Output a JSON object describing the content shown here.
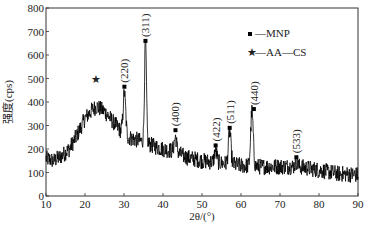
{
  "chart_data": {
    "type": "line",
    "title": "",
    "xlabel": "2θ/(°)",
    "ylabel": "强度(cps)",
    "xlim": [
      10,
      90
    ],
    "ylim": [
      0,
      800
    ],
    "xticks": [
      10,
      20,
      30,
      40,
      50,
      60,
      70,
      80,
      90
    ],
    "yticks": [
      0,
      100,
      200,
      300,
      400,
      500,
      600,
      700,
      800
    ],
    "grid": false,
    "legend": {
      "position": "upper right",
      "entries": [
        {
          "marker": "square",
          "label": "—MNP"
        },
        {
          "marker": "star",
          "label": "—AA—CS"
        }
      ]
    },
    "series": [
      {
        "name": "XRD pattern",
        "baseline_points": [
          [
            10,
            160
          ],
          [
            12,
            150
          ],
          [
            14,
            170
          ],
          [
            16,
            200
          ],
          [
            18,
            260
          ],
          [
            20,
            330
          ],
          [
            22,
            370
          ],
          [
            23,
            380
          ],
          [
            25,
            360
          ],
          [
            27,
            320
          ],
          [
            29,
            280
          ],
          [
            31,
            250
          ],
          [
            33,
            240
          ],
          [
            35,
            230
          ],
          [
            38,
            210
          ],
          [
            40,
            200
          ],
          [
            43,
            190
          ],
          [
            46,
            165
          ],
          [
            50,
            150
          ],
          [
            55,
            140
          ],
          [
            60,
            130
          ],
          [
            65,
            125
          ],
          [
            70,
            125
          ],
          [
            75,
            125
          ],
          [
            80,
            110
          ],
          [
            85,
            95
          ],
          [
            90,
            90
          ]
        ],
        "peaks": [
          {
            "x": 30.1,
            "y": 440,
            "hkl": "(220)",
            "phase": "MNP"
          },
          {
            "x": 35.5,
            "y": 655,
            "hkl": "(311)",
            "phase": "MNP"
          },
          {
            "x": 43.2,
            "y": 250,
            "hkl": "(400)",
            "phase": "MNP"
          },
          {
            "x": 53.5,
            "y": 195,
            "hkl": "(422)",
            "phase": "MNP"
          },
          {
            "x": 57.1,
            "y": 275,
            "hkl": "(511)",
            "phase": "MNP"
          },
          {
            "x": 62.8,
            "y": 360,
            "hkl": "(440)",
            "phase": "MNP"
          },
          {
            "x": 74.2,
            "y": 145,
            "hkl": "(533)",
            "phase": "MNP"
          }
        ],
        "broad_peak": {
          "x": 22.8,
          "y": 430,
          "marker": "star",
          "phase": "AA—CS"
        },
        "noise_amplitude": 35
      }
    ],
    "annotations": [
      {
        "text": "(220)",
        "x": 30.1,
        "y": 465
      },
      {
        "text": "(311)",
        "x": 35.5,
        "y": 660
      },
      {
        "text": "(400)",
        "x": 43.2,
        "y": 280
      },
      {
        "text": "(422)",
        "x": 53.5,
        "y": 215
      },
      {
        "text": "(511)",
        "x": 57.1,
        "y": 290
      },
      {
        "text": "(440)",
        "x": 63.3,
        "y": 370
      },
      {
        "text": "(533)",
        "x": 74.2,
        "y": 165
      },
      {
        "text": "★",
        "x": 22.8,
        "y": 480
      }
    ]
  },
  "labels": {
    "xlabel": "2θ/(°)",
    "ylabel": "强度(cps)",
    "legend_mnp": "—MNP",
    "legend_aacs": "—AA—CS"
  }
}
